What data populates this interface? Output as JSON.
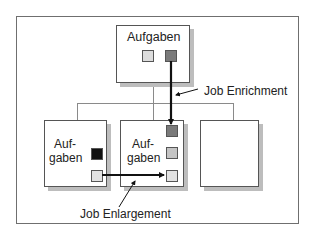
{
  "diagram": {
    "top_box": {
      "label": "Aufgaben"
    },
    "bottom_boxes": [
      {
        "label_line1": "Auf-",
        "label_line2": "gaben"
      },
      {
        "label_line1": "Auf-",
        "label_line2": "gaben"
      },
      {
        "label_line1": "",
        "label_line2": ""
      }
    ],
    "annotations": {
      "enrichment": "Job Enrichment",
      "enlargement": "Job Enlargement"
    },
    "colors": {
      "task_light": "#dcdcdc",
      "task_mid": "#c4c4c4",
      "task_dark": "#7a7a7a",
      "task_black": "#111111",
      "arrow": "#111111",
      "connector": "#8a8a8a"
    }
  }
}
